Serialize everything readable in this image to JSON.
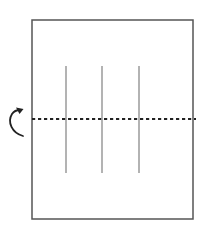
{
  "diagram": {
    "colors": {
      "background": "#ffffff",
      "paper_border": "#555555",
      "crease_lines": "#b3b3b3",
      "fold_line": "#222222",
      "arrow": "#222222"
    },
    "paper": {
      "x": 32,
      "y": 20,
      "width": 161,
      "height": 199
    },
    "crease_lines": [
      {
        "x": 66,
        "y1": 66,
        "y2": 173
      },
      {
        "x": 102,
        "y1": 66,
        "y2": 173
      },
      {
        "x": 139,
        "y1": 66,
        "y2": 173
      }
    ],
    "fold_line": {
      "y": 119,
      "x1": 32,
      "x2": 196,
      "style": "dotted"
    },
    "fold_arrow": {
      "icon": "curved-fold-arrow-icon",
      "direction": "fold-up-and-over"
    }
  }
}
